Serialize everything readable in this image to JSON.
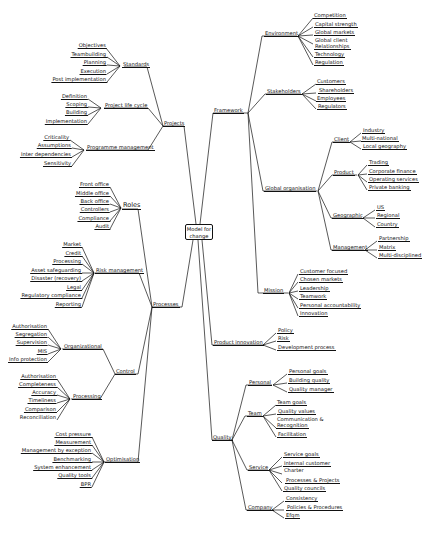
{
  "root": {
    "label_line1": "Model for",
    "label_line2": "change"
  },
  "header": {
    "text": ""
  },
  "left": {
    "projects": {
      "label": "Projects",
      "standards": {
        "label": "Standards",
        "items": [
          "Objectives",
          "Teambuilding",
          "Planning",
          "Execution",
          "Post implementation"
        ]
      },
      "lifecycle": {
        "label": "Project life cycle",
        "items": [
          "Definition",
          "Scoping",
          "Building",
          "Implementation"
        ]
      },
      "programme": {
        "label": "Programme management",
        "items": [
          "Criticality",
          "Assumptions",
          "Inter dependencies",
          "Sensitivity"
        ]
      }
    },
    "processes": {
      "label": "Processes",
      "roles": {
        "label": "Roles",
        "items": [
          "Front office",
          "Middle office",
          "Back office",
          "Controllers",
          "Compliance",
          "Audit"
        ]
      },
      "risk": {
        "label": "Risk management",
        "items": [
          "Market",
          "Credit",
          "Processing",
          "Asset safeguarding",
          "Disaster (recovery)",
          "Legal",
          "Regulatory compliance",
          "Reporting"
        ]
      },
      "control": {
        "label": "Control",
        "organizational": {
          "label": "Organizational",
          "items": [
            "Authorisation",
            "Segregation",
            "Supervision",
            "MIS",
            "Info protection"
          ]
        },
        "processing": {
          "label": "Processing",
          "items": [
            "Authorisation",
            "Completeness",
            "Accuracy",
            "Timeliness",
            "Comparison",
            "Reconciliation"
          ]
        }
      },
      "optimisation": {
        "label": "Optimisation",
        "items": [
          "Cost pressure",
          "Measurement",
          "Management by exception",
          "Benchmarking",
          "System enhancement",
          "Quality tools",
          "BPR"
        ]
      }
    }
  },
  "right": {
    "framework": {
      "label": "Framework",
      "environment": {
        "label": "Environment",
        "items": [
          "Competition",
          "Capital strength",
          "Global markets",
          "Global client",
          "Relationships",
          "Technology",
          "Regulation"
        ]
      },
      "stakeholders": {
        "label": "Stakeholders",
        "items": [
          "Customers",
          "Shareholders",
          "Employees",
          "Regulators"
        ]
      },
      "global": {
        "label": "Global organisation",
        "client": {
          "label": "Client",
          "items": [
            "Industry",
            "Multi-national",
            "Local geography"
          ]
        },
        "product": {
          "label": "Product",
          "items": [
            "Trading",
            "Corporate finance",
            "Operating services",
            "Private banking"
          ]
        },
        "geographic": {
          "label": "Geographic",
          "items": [
            "US",
            "Regional",
            "Country"
          ]
        },
        "management": {
          "label": "Management",
          "items": [
            "Partnership",
            "Matrix",
            "Multi-disciplined"
          ]
        }
      },
      "mission": {
        "label": "Mission",
        "items": [
          "Customer focused",
          "Chosen markets",
          "Leadership",
          "Teamwork",
          "Personal accountability",
          "Innovation"
        ]
      }
    },
    "product_innovation": {
      "label": "Product innovation",
      "items": [
        "Policy",
        "Risk",
        "Development process"
      ]
    },
    "quality": {
      "label": "Quality",
      "personal": {
        "label": "Personal",
        "items": [
          "Personal goals",
          "Building quality",
          "Quality manager"
        ]
      },
      "team": {
        "label": "Team",
        "items": [
          "Team goals",
          "Quality values",
          "Communication &",
          "Recognition",
          "Facilitation"
        ]
      },
      "service": {
        "label": "Service",
        "items": [
          "Service goals",
          "Internal customer",
          "Charter",
          "Processes & Projects",
          "Quality councils"
        ]
      },
      "company": {
        "label": "Company",
        "items": [
          "Consistency",
          "Policies & Procedures",
          "Efqm"
        ]
      }
    }
  }
}
